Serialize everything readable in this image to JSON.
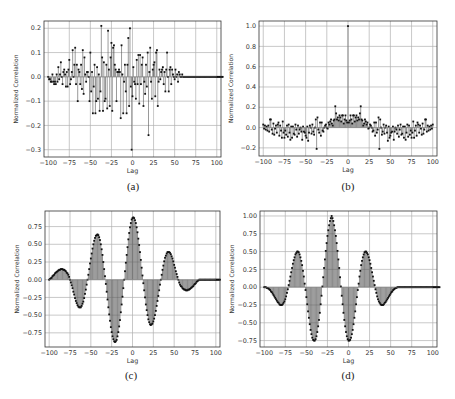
{
  "figure": {
    "captions": [
      "(a)",
      "(b)",
      "(c)",
      "(d)"
    ]
  },
  "chart_data": [
    {
      "id": "a",
      "type": "stem",
      "title": "",
      "xlabel": "Lag",
      "ylabel": "Normalized Correlation",
      "xlim": [
        -105,
        105
      ],
      "ylim": [
        -0.33,
        0.23
      ],
      "xticks": [
        -100,
        -75,
        -50,
        -25,
        0,
        25,
        50,
        75,
        100
      ],
      "xtick_labels": [
        "−100",
        "−75",
        "−50",
        "−25",
        "0",
        "25",
        "50",
        "75",
        "100"
      ],
      "yticks": [
        -0.3,
        -0.2,
        -0.1,
        0.0,
        0.1,
        0.2
      ],
      "ytick_labels": [
        "−0.3",
        "−0.2",
        "−0.1",
        "0.0",
        "0.1",
        "0.2"
      ],
      "grid": true,
      "x_start": -100,
      "values": [
        0.0,
        -0.01,
        -0.01,
        -0.02,
        -0.02,
        0.01,
        -0.02,
        -0.03,
        -0.02,
        -0.03,
        0.01,
        -0.02,
        0.04,
        -0.01,
        0.01,
        0.06,
        0.0,
        -0.03,
        0.02,
        0.03,
        0.01,
        -0.04,
        0.02,
        -0.04,
        0.03,
        0.07,
        -0.03,
        -0.01,
        0.02,
        0.11,
        0.0,
        0.05,
        0.12,
        -0.03,
        0.05,
        -0.1,
        0.03,
        0.02,
        -0.03,
        0.05,
        -0.05,
        0.11,
        -0.07,
        0.08,
        0.01,
        -0.02,
        0.02,
        0.02,
        0.0,
        -0.1,
        0.1,
        -0.06,
        0.02,
        -0.15,
        -0.04,
        0.05,
        -0.15,
        -0.1,
        0.04,
        -0.09,
        0.01,
        -0.14,
        -0.06,
        0.21,
        0.08,
        -0.14,
        0.06,
        -0.1,
        -0.09,
        0.05,
        -0.13,
        0.19,
        0.03,
        -0.12,
        0.08,
        0.14,
        -0.14,
        0.12,
        0.13,
        0.05,
        0.03,
        -0.1,
        0.02,
        0.02,
        0.03,
        0.02,
        -0.17,
        0.13,
        0.01,
        -0.15,
        -0.02,
        0.05,
        -0.06,
        -0.15,
        0.05,
        0.16,
        -0.12,
        0.2,
        -0.04,
        -0.3,
        -0.08,
        0.04,
        -0.02,
        -0.03,
        -0.09,
        0.07,
        -0.03,
        0.09,
        -0.11,
        0.09,
        -0.03,
        0.05,
        0.08,
        -0.12,
        -0.02,
        -0.07,
        0.05,
        -0.04,
        0.1,
        -0.24,
        0.02,
        0.12,
        -0.02,
        -0.09,
        0.03,
        0.05,
        0.06,
        -0.08,
        0.1,
        0.11,
        -0.12,
        -0.02,
        0.03,
        -0.01,
        0.02,
        0.03,
        0.04,
        -0.03,
        0.02,
        -0.06,
        0.03,
        0.1,
        0.0,
        -0.06,
        0.03,
        0.04,
        -0.03,
        0.03,
        0.01,
        0.0,
        -0.01,
        0.03,
        0.0,
        0.01,
        -0.02,
        0.02,
        0.01,
        0.0,
        0.0,
        0.01,
        0.0,
        0.0,
        0.0,
        0.0,
        0.0,
        0.0,
        0.0,
        0.0,
        0.0,
        0.0,
        0.0,
        0.0,
        0.0,
        0.0,
        0.0,
        0.0,
        0.0,
        0.0,
        0.0,
        0.0,
        0.0,
        0.0,
        0.0,
        0.0,
        0.0,
        0.0,
        0.0,
        0.0,
        0.0,
        0.0,
        0.0,
        0.0,
        0.0,
        0.0,
        0.0,
        0.0,
        0.0,
        0.0,
        0.0,
        0.0,
        0.0,
        0.0,
        0.0,
        0.0,
        0.0,
        0.0,
        0.0,
        0.0
      ]
    },
    {
      "id": "b",
      "type": "stem",
      "title": "",
      "xlabel": "Lag",
      "ylabel": "Normalized Correlation",
      "xlim": [
        -105,
        105
      ],
      "ylim": [
        -0.28,
        1.05
      ],
      "xticks": [
        -100,
        -75,
        -50,
        -25,
        0,
        25,
        50,
        75,
        100
      ],
      "xtick_labels": [
        "−100",
        "−75",
        "−50",
        "−25",
        "0",
        "25",
        "50",
        "75",
        "100"
      ],
      "yticks": [
        -0.2,
        0.0,
        0.2,
        0.4,
        0.6,
        0.8,
        1.0
      ],
      "ytick_labels": [
        "−0.2",
        "0.0",
        "0.2",
        "0.4",
        "0.6",
        "0.8",
        "1.0"
      ],
      "grid": true,
      "x_start": -100,
      "values": [
        0.03,
        -0.01,
        0.02,
        -0.02,
        0.01,
        -0.03,
        0.02,
        -0.04,
        0.08,
        0.08,
        -0.02,
        -0.06,
        0.04,
        -0.07,
        -0.01,
        0.02,
        -0.05,
        0.03,
        0.05,
        -0.08,
        0.02,
        -0.03,
        -0.1,
        0.06,
        -0.05,
        -0.1,
        -0.03,
        -0.07,
        0.02,
        -0.09,
        0.03,
        -0.05,
        -0.12,
        0.01,
        -0.1,
        0.01,
        -0.06,
        -0.07,
        0.03,
        -0.02,
        -0.09,
        0.02,
        -0.06,
        -0.02,
        0.0,
        -0.04,
        -0.12,
        0.01,
        -0.04,
        -0.05,
        -0.08,
        -0.1,
        0.01,
        -0.13,
        -0.05,
        0.02,
        0.0,
        -0.06,
        0.03,
        -0.04,
        -0.07,
        0.0,
        0.08,
        -0.21,
        0.1,
        -0.02,
        -0.05,
        0.05,
        -0.08,
        0.05,
        -0.03,
        -0.04,
        0.0,
        0.02,
        0.03,
        0.0,
        -0.01,
        0.05,
        0.03,
        0.06,
        0.08,
        0.04,
        0.02,
        0.07,
        0.08,
        0.21,
        0.14,
        0.08,
        0.1,
        0.07,
        0.12,
        0.1,
        0.06,
        0.12,
        0.12,
        0.04,
        0.08,
        0.12,
        0.07,
        0.05,
        1.0,
        0.05,
        0.07,
        0.12,
        0.08,
        0.04,
        0.12,
        0.12,
        0.06,
        0.1,
        0.12,
        0.07,
        0.1,
        0.08,
        0.14,
        0.21,
        0.08,
        0.07,
        0.02,
        0.04,
        0.08,
        0.06,
        0.03,
        0.05,
        -0.01,
        0.0,
        0.03,
        0.02,
        0.0,
        -0.04,
        -0.03,
        0.05,
        -0.08,
        0.05,
        -0.05,
        -0.02,
        0.1,
        -0.21,
        0.08,
        0.0,
        -0.07,
        -0.04,
        0.03,
        -0.06,
        0.0,
        0.02,
        -0.05,
        -0.13,
        0.01,
        -0.1,
        -0.08,
        -0.05,
        -0.04,
        0.01,
        -0.12,
        -0.04,
        0.0,
        -0.02,
        -0.06,
        0.02,
        -0.09,
        -0.02,
        0.03,
        -0.07,
        -0.06,
        0.01,
        -0.1,
        0.01,
        -0.12,
        -0.05,
        0.03,
        -0.09,
        0.02,
        -0.07,
        -0.03,
        -0.1,
        -0.05,
        0.06,
        -0.1,
        -0.03,
        0.02,
        -0.08,
        0.05,
        0.03,
        -0.05,
        0.02,
        -0.01,
        -0.07,
        0.04,
        -0.06,
        -0.02,
        0.08,
        0.08,
        -0.04,
        0.02,
        -0.03,
        0.01,
        -0.02,
        0.02,
        -0.01,
        0.03
      ]
    },
    {
      "id": "c",
      "type": "stem",
      "title": "",
      "xlabel": "Lag",
      "ylabel": "Normalized Correlation",
      "xlim": [
        -105,
        105
      ],
      "ylim": [
        -0.95,
        0.97
      ],
      "xticks": [
        -100,
        -75,
        -50,
        -25,
        0,
        25,
        50,
        75,
        100
      ],
      "xtick_labels": [
        "−100",
        "−75",
        "−50",
        "−25",
        "0",
        "25",
        "50",
        "75",
        "100"
      ],
      "yticks": [
        -0.75,
        -0.5,
        -0.25,
        0.0,
        0.25,
        0.5,
        0.75
      ],
      "ytick_labels": [
        "−0.75",
        "−0.50",
        "−0.25",
        "0.00",
        "0.25",
        "0.50",
        "0.75"
      ],
      "grid": true,
      "x_start": -100,
      "description": "envelope (1-|k|/100) times sin(2*pi*k/50)",
      "values": [
        0.0,
        0.01,
        0.02,
        0.03,
        0.05,
        0.06,
        0.07,
        0.09,
        0.1,
        0.11,
        0.12,
        0.13,
        0.14,
        0.14,
        0.15,
        0.15,
        0.15,
        0.14,
        0.14,
        0.13,
        0.12,
        0.1,
        0.09,
        0.07,
        0.04,
        0.0,
        -0.04,
        -0.08,
        -0.12,
        -0.17,
        -0.21,
        -0.26,
        -0.3,
        -0.33,
        -0.36,
        -0.38,
        -0.39,
        -0.39,
        -0.39,
        -0.37,
        -0.34,
        -0.31,
        -0.26,
        -0.2,
        -0.14,
        -0.07,
        0.0,
        0.07,
        0.15,
        0.23,
        0.3,
        0.37,
        0.44,
        0.5,
        0.55,
        0.59,
        0.62,
        0.63,
        0.64,
        0.63,
        0.6,
        0.56,
        0.5,
        0.43,
        0.35,
        0.25,
        0.15,
        0.05,
        -0.06,
        -0.17,
        -0.28,
        -0.39,
        -0.49,
        -0.58,
        -0.67,
        -0.74,
        -0.8,
        -0.84,
        -0.87,
        -0.88,
        -0.87,
        -0.85,
        -0.8,
        -0.74,
        -0.66,
        -0.57,
        -0.46,
        -0.35,
        -0.24,
        -0.12,
        0.0,
        0.12,
        0.24,
        0.35,
        0.46,
        0.57,
        0.66,
        0.74,
        0.8,
        0.85,
        0.87,
        0.88,
        0.87,
        0.84,
        0.8,
        0.74,
        0.67,
        0.58,
        0.49,
        0.39,
        0.28,
        0.17,
        0.06,
        -0.05,
        -0.15,
        -0.25,
        -0.35,
        -0.43,
        -0.5,
        -0.56,
        -0.6,
        -0.63,
        -0.64,
        -0.63,
        -0.62,
        -0.59,
        -0.55,
        -0.5,
        -0.44,
        -0.37,
        -0.3,
        -0.23,
        -0.15,
        -0.07,
        0.0,
        0.07,
        0.14,
        0.2,
        0.26,
        0.31,
        0.34,
        0.37,
        0.39,
        0.39,
        0.39,
        0.38,
        0.36,
        0.33,
        0.3,
        0.26,
        0.21,
        0.17,
        0.12,
        0.08,
        0.04,
        0.0,
        -0.04,
        -0.07,
        -0.09,
        -0.1,
        -0.12,
        -0.13,
        -0.14,
        -0.14,
        -0.15,
        -0.15,
        -0.15,
        -0.14,
        -0.14,
        -0.13,
        -0.12,
        -0.11,
        -0.1,
        -0.09,
        -0.07,
        -0.06,
        -0.05,
        -0.03,
        -0.02,
        -0.01,
        0.0,
        0.0,
        0.0,
        0.0,
        0.0,
        0.0,
        0.0,
        0.0,
        0.0,
        0.0,
        0.0,
        0.0,
        0.0,
        0.0,
        0.0,
        0.0,
        0.0,
        0.0,
        0.0,
        0.0,
        0.0,
        0.0,
        0.0,
        0.0,
        0.0,
        0.0
      ]
    },
    {
      "id": "d",
      "type": "stem",
      "title": "",
      "xlabel": "Lag",
      "ylabel": "Normalized Correlation",
      "xlim": [
        -105,
        105
      ],
      "ylim": [
        -0.84,
        1.07
      ],
      "xticks": [
        -100,
        -75,
        -50,
        -25,
        0,
        25,
        50,
        75,
        100
      ],
      "xtick_labels": [
        "−100",
        "−75",
        "−50",
        "−25",
        "0",
        "25",
        "50",
        "75",
        "100"
      ],
      "yticks": [
        -0.75,
        -0.5,
        -0.25,
        0.0,
        0.25,
        0.5,
        0.75,
        1.0
      ],
      "ytick_labels": [
        "−0.75",
        "−0.50",
        "−0.25",
        "0.00",
        "0.25",
        "0.50",
        "0.75",
        "1.00"
      ],
      "grid": true,
      "x_start": -100,
      "description": "envelope (1-|k|/100) times cos(2*pi*k/50)",
      "values": [
        0.0,
        0.0,
        0.0,
        -0.01,
        -0.01,
        -0.02,
        -0.03,
        -0.04,
        -0.06,
        -0.07,
        -0.09,
        -0.11,
        -0.13,
        -0.15,
        -0.17,
        -0.19,
        -0.21,
        -0.22,
        -0.24,
        -0.25,
        -0.25,
        -0.25,
        -0.24,
        -0.22,
        -0.2,
        -0.17,
        -0.13,
        -0.08,
        -0.03,
        0.03,
        0.09,
        0.15,
        0.21,
        0.27,
        0.33,
        0.38,
        0.42,
        0.46,
        0.48,
        0.5,
        0.5,
        0.49,
        0.46,
        0.42,
        0.37,
        0.31,
        0.23,
        0.15,
        0.05,
        -0.04,
        -0.14,
        -0.24,
        -0.34,
        -0.43,
        -0.52,
        -0.6,
        -0.66,
        -0.71,
        -0.74,
        -0.75,
        -0.75,
        -0.73,
        -0.69,
        -0.63,
        -0.55,
        -0.46,
        -0.36,
        -0.24,
        -0.12,
        0.01,
        0.14,
        0.27,
        0.39,
        0.51,
        0.62,
        0.72,
        0.8,
        0.87,
        0.93,
        0.97,
        1.0,
        0.97,
        0.93,
        0.87,
        0.8,
        0.72,
        0.62,
        0.51,
        0.39,
        0.27,
        0.14,
        0.01,
        -0.12,
        -0.24,
        -0.36,
        -0.46,
        -0.55,
        -0.63,
        -0.69,
        -0.73,
        -0.75,
        -0.75,
        -0.74,
        -0.71,
        -0.66,
        -0.6,
        -0.52,
        -0.43,
        -0.34,
        -0.24,
        -0.14,
        -0.04,
        0.05,
        0.15,
        0.23,
        0.31,
        0.37,
        0.42,
        0.46,
        0.49,
        0.5,
        0.5,
        0.48,
        0.46,
        0.42,
        0.38,
        0.33,
        0.27,
        0.21,
        0.15,
        0.09,
        0.03,
        -0.03,
        -0.08,
        -0.13,
        -0.17,
        -0.2,
        -0.22,
        -0.24,
        -0.25,
        -0.25,
        -0.25,
        -0.24,
        -0.22,
        -0.21,
        -0.19,
        -0.17,
        -0.15,
        -0.13,
        -0.11,
        -0.09,
        -0.07,
        -0.06,
        -0.04,
        -0.03,
        -0.02,
        -0.01,
        -0.01,
        0.0,
        0.0,
        0.0,
        0.0,
        0.0,
        0.0,
        0.0,
        0.0,
        0.0,
        0.0,
        0.0,
        0.0,
        0.0,
        0.0,
        0.0,
        0.0,
        0.0,
        0.0,
        0.0,
        0.0,
        0.0,
        0.0,
        0.0,
        0.0,
        0.0,
        0.0,
        0.0,
        0.0,
        0.0,
        0.0,
        0.0,
        0.0,
        0.0,
        0.0,
        0.0,
        0.0,
        0.0,
        0.0,
        0.0,
        0.0,
        0.0,
        0.0,
        0.0,
        0.0,
        0.0,
        0.0,
        0.0,
        0.0,
        0.0,
        0.0,
        0.0
      ]
    }
  ],
  "layout_colors": {
    "stem": "#555555",
    "marker": "#111111",
    "grid": "#b0b0b0",
    "frame": "#333333",
    "fill": "#555555"
  }
}
